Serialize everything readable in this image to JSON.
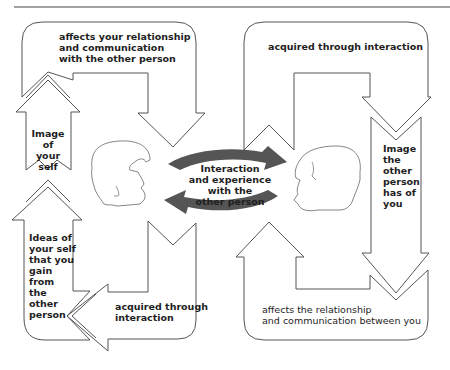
{
  "colors": {
    "outline": "#555555",
    "rule": "#444444",
    "cycle_arrow": "#555555",
    "text": "#1e1e1e",
    "background": "#ffffff"
  },
  "left_panel": {
    "top_loop_label": [
      "affects your relationship",
      "and communication",
      "with the other person"
    ],
    "upper_column_label": [
      "Image of",
      "your self"
    ],
    "lower_column_label": [
      "Ideas of",
      "your self",
      "that you",
      "gain",
      "from",
      "the",
      "other",
      "person"
    ],
    "bottom_loop_label": [
      "acquired through",
      "interaction"
    ]
  },
  "right_panel": {
    "top_loop_label": [
      "acquired through interaction"
    ],
    "column_label": [
      "Image",
      "the",
      "other",
      "person",
      "has of",
      "you"
    ],
    "bottom_loop_label": [
      "affects the relationship",
      "and communication between you"
    ]
  },
  "center": {
    "label": [
      "Interaction",
      "and experience",
      "with the",
      "other person"
    ],
    "cycle": "two curved arrows forming a cycle between the two heads"
  },
  "figures": {
    "left_head": "outline of a head facing right",
    "right_head": "outline of a head facing left"
  }
}
